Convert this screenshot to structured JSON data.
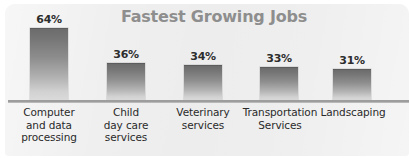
{
  "chart_data": {
    "type": "bar",
    "title": "Fastest Growing Jobs",
    "xlabel": "",
    "ylabel": "",
    "grid": false,
    "legend": "none",
    "categories": [
      "Computer and data processing",
      "Child day care services",
      "Veterinary services",
      "Transportation Services",
      "Landscaping"
    ],
    "values": [
      64,
      36,
      34,
      33,
      31
    ],
    "value_labels": [
      "64%",
      "36%",
      "34%",
      "33%",
      "31%"
    ],
    "ylim": [
      0,
      70
    ],
    "value_unit": "%"
  },
  "bars": [
    {
      "value_label": "64%",
      "label_lines": [
        "Computer",
        "and data",
        "processing"
      ],
      "left": 30,
      "width": 38,
      "top": 28,
      "value_left": 22,
      "value_top": 13,
      "label_left": 12,
      "label_width": 74
    },
    {
      "value_label": "36%",
      "label_lines": [
        "Child",
        "day care",
        "services"
      ],
      "left": 107,
      "width": 38,
      "top": 63,
      "value_left": 99,
      "value_top": 48,
      "label_left": 89,
      "label_width": 74
    },
    {
      "value_label": "34%",
      "label_lines": [
        "Veterinary",
        "services"
      ],
      "left": 184,
      "width": 38,
      "top": 65,
      "value_left": 176,
      "value_top": 50,
      "label_left": 165,
      "label_width": 76
    },
    {
      "value_label": "33%",
      "label_lines": [
        "Transportation",
        "Services"
      ],
      "left": 260,
      "width": 38,
      "top": 67,
      "value_left": 252,
      "value_top": 52,
      "label_left": 238,
      "label_width": 84
    },
    {
      "value_label": "31%",
      "label_lines": [
        "Landscaping"
      ],
      "left": 333,
      "width": 38,
      "top": 69,
      "value_left": 325,
      "value_top": 54,
      "label_left": 320,
      "label_width": 66
    }
  ],
  "colors": {
    "panel_background": "#ededed",
    "page_background": "#ffffff",
    "title_text": "#8e8e8e",
    "bar_top": "#6c6c6c",
    "bar_bottom": "#dcdcdc",
    "axis_line": "#9d9d9d",
    "label_text": "#2a2a2a",
    "value_text": "#2d2d2d"
  }
}
